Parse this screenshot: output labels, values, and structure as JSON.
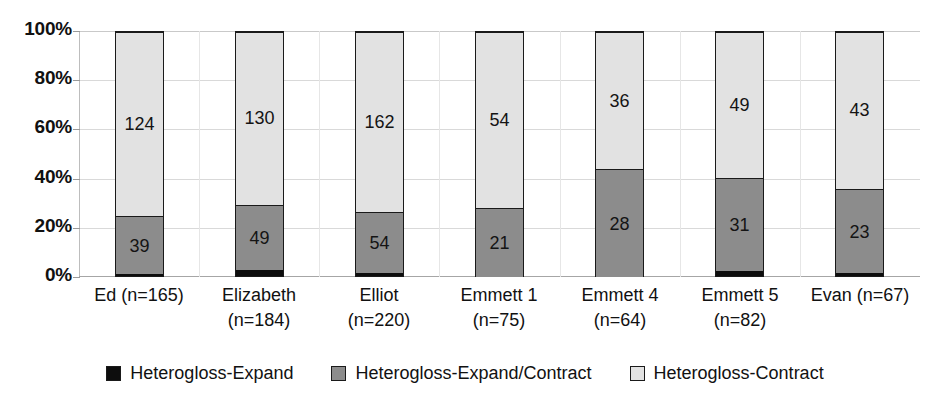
{
  "chart_data": {
    "type": "bar",
    "subtype": "stacked-100-percent",
    "title": "",
    "xlabel": "",
    "ylabel": "",
    "ylim": [
      0,
      100
    ],
    "y_tick_labels": [
      "0%",
      "20%",
      "40%",
      "60%",
      "80%",
      "100%"
    ],
    "y_tick_values": [
      0,
      20,
      40,
      60,
      80,
      100
    ],
    "grid": true,
    "legend_position": "bottom",
    "categories": [
      "Ed (n=165)",
      "Elizabeth (n=184)",
      "Elliot (n=220)",
      "Emmett 1 (n=75)",
      "Emmett 4 (n=64)",
      "Emmett 5 (n=82)",
      "Evan (n=67)"
    ],
    "category_lines": [
      [
        "Ed (n=165)",
        ""
      ],
      [
        "Elizabeth",
        "(n=184)"
      ],
      [
        "Elliot",
        "(n=220)"
      ],
      [
        "Emmett 1",
        "(n=75)"
      ],
      [
        "Emmett 4",
        "(n=64)"
      ],
      [
        "Emmett 5",
        "(n=82)"
      ],
      [
        "Evan (n=67)",
        ""
      ]
    ],
    "totals": [
      165,
      184,
      220,
      75,
      64,
      82,
      67
    ],
    "series": [
      {
        "name": "Heterogloss-Expand",
        "color": "#0d0d0d",
        "values": [
          2,
          5,
          4,
          0,
          0,
          2,
          1
        ],
        "percents": [
          1.2,
          2.7,
          1.8,
          0.0,
          0.0,
          2.4,
          1.5
        ],
        "labels": [
          "",
          "",
          "",
          "",
          "",
          "",
          ""
        ]
      },
      {
        "name": "Heterogloss-Expand/Contract",
        "color": "#8c8c8c",
        "values": [
          39,
          49,
          54,
          21,
          28,
          31,
          23
        ],
        "percents": [
          23.6,
          26.6,
          24.5,
          28.0,
          43.8,
          37.8,
          34.3
        ],
        "labels": [
          "39",
          "49",
          "54",
          "21",
          "28",
          "31",
          "23"
        ]
      },
      {
        "name": "Heterogloss-Contract",
        "color": "#e2e2e2",
        "values": [
          124,
          130,
          162,
          54,
          36,
          49,
          43
        ],
        "percents": [
          75.2,
          70.7,
          73.6,
          72.0,
          56.2,
          59.8,
          64.2
        ],
        "labels": [
          "124",
          "130",
          "162",
          "54",
          "36",
          "49",
          "43"
        ]
      }
    ]
  },
  "legend": {
    "items": [
      {
        "label": "Heterogloss-Expand",
        "color": "#0d0d0d"
      },
      {
        "label": "Heterogloss-Expand/Contract",
        "color": "#8c8c8c"
      },
      {
        "label": "Heterogloss-Contract",
        "color": "#e2e2e2"
      }
    ]
  },
  "axis": {
    "y_labels": [
      "100%",
      "80%",
      "60%",
      "40%",
      "20%",
      "0%"
    ]
  }
}
